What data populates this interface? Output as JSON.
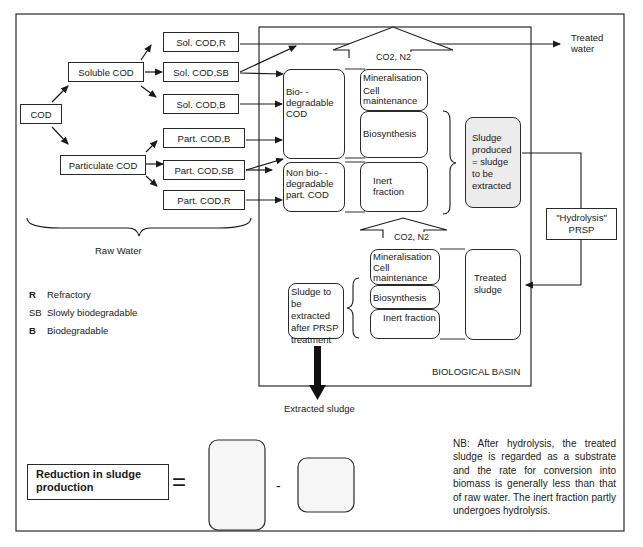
{
  "diagram": {
    "raw_water": {
      "root": "COD",
      "branches": [
        {
          "label": "Soluble COD",
          "children": [
            "Sol. COD,R",
            "Sol. COD,SB",
            "Sol. COD,B"
          ]
        },
        {
          "label": "Particulate COD",
          "children": [
            "Part. COD,B",
            "Part. COD,SB",
            "Part. COD,R"
          ]
        }
      ],
      "group_label": "Raw Water"
    },
    "legend": [
      {
        "key": "R",
        "meaning": "Refractory"
      },
      {
        "key": "SB",
        "meaning": "Slowly biodegradable"
      },
      {
        "key": "B",
        "meaning": "Biodegradable"
      }
    ],
    "basin": {
      "label": "BIOLOGICAL BASIN",
      "upper": {
        "gas_arrow": "CO2, N2",
        "biodegradable": "Bio- -degradable COD",
        "non_biodegradable": "Non bio- -degradable part. COD",
        "processes": {
          "mineralisation": "Mineralisation",
          "cell_maintenance": "Cell maintenance",
          "biosynthesis": "Biosynthesis",
          "inert": "Inert fraction"
        },
        "sludge_produced": "Sludge produced = sludge to be extracted"
      },
      "lower": {
        "gas_arrow": "CO2, N2",
        "processes": {
          "mineralisation": "Mineralisation",
          "cell_maintenance": "Cell maintenance",
          "biosynthesis": "Biosynthesis",
          "inert": "Inert fraction"
        },
        "treated_sludge": "Treated sludge",
        "sludge_after_prsp": "Sludge to be extracted after PRSP treatment"
      }
    },
    "treated_water": "Treated water",
    "hydrolysis_box": {
      "line1": "\"Hydrolysis\"",
      "line2": "PRSP"
    },
    "extracted_sludge": "Extracted sludge",
    "equation": {
      "lhs": "Reduction in sludge production",
      "equals": "=",
      "minus": "-"
    },
    "note": "NB: After hydrolysis, the treated sludge is regarded as a substrate and the rate for conversion into biomass is generally less than that of raw water. The inert fraction partly undergoes hydrolysis."
  }
}
